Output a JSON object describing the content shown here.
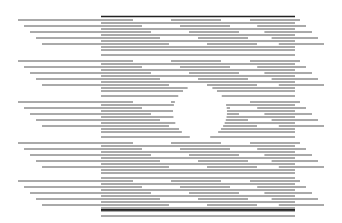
{
  "figure": {
    "type": "illusory-circle-line-pattern",
    "width": 342,
    "height": 223,
    "line_color": "#555555",
    "border_color": "#222222",
    "block": {
      "x1": 101,
      "x2": 295,
      "y_top": 16.5,
      "y_bottom": 210
    },
    "pitch": 3,
    "circle": {
      "cx": 200,
      "cy": 112,
      "r": 27
    },
    "groups": [
      {
        "y0": 20,
        "left_starts": [
          18,
          24,
          30,
          36,
          42
        ],
        "right_ends": [
          300,
          306,
          312,
          318,
          324
        ],
        "split_offsets": [
          0,
          6,
          12,
          18,
          24
        ]
      },
      {
        "y0": 61,
        "left_starts": [
          18,
          24,
          30,
          36,
          42
        ],
        "right_ends": [
          300,
          306,
          312,
          318,
          324
        ],
        "split_offsets": [
          0,
          6,
          12,
          18,
          24
        ]
      },
      {
        "y0": 102,
        "left_starts": [
          18,
          24,
          30,
          36,
          42
        ],
        "right_ends": [
          300,
          306,
          312,
          318,
          324
        ],
        "split_offsets": [
          0,
          6,
          12,
          18,
          24
        ]
      },
      {
        "y0": 143,
        "left_starts": [
          18,
          24,
          30,
          36,
          42
        ],
        "right_ends": [
          300,
          306,
          312,
          318,
          324
        ],
        "split_offsets": [
          0,
          6,
          12,
          18,
          24
        ]
      },
      {
        "y0": 181,
        "left_starts": [
          18,
          24,
          30,
          36,
          42
        ],
        "right_ends": [
          300,
          306,
          312,
          318,
          324
        ],
        "split_offsets": [
          0,
          6,
          12,
          18,
          24
        ]
      }
    ]
  }
}
